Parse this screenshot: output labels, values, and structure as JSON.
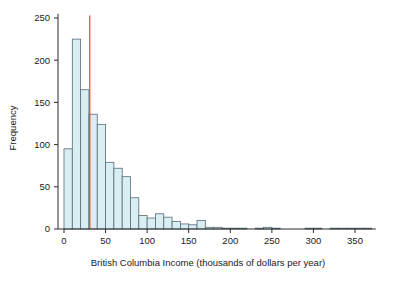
{
  "figure": {
    "background_color": "#ffffff",
    "axis_color": "#2b2b2b",
    "text_color": "#1a1a1a"
  },
  "axes": {
    "y_title": "Frequency",
    "x_title": "British Columbia Income (thousands of dollars per year)",
    "y_ticks": [
      0,
      50,
      100,
      150,
      200,
      250
    ],
    "x_ticks": [
      0,
      50,
      100,
      150,
      200,
      250,
      300,
      350
    ],
    "y_tick_labels": [
      "0",
      "50",
      "100",
      "150",
      "200",
      "250"
    ],
    "x_tick_labels": [
      "0",
      "50",
      "100",
      "150",
      "200",
      "250",
      "300",
      "350"
    ]
  },
  "chart_data": {
    "type": "bar",
    "title": "",
    "subtitle": "",
    "xlabel": "British Columbia Income (thousands of dollars per year)",
    "ylabel": "Frequency",
    "xlim": [
      0,
      375
    ],
    "ylim": [
      0,
      255
    ],
    "grid": false,
    "legend": null,
    "bin_width": 10,
    "bar_fill_color": "#d9eef2",
    "bar_edge_color": "#5a6b73",
    "bin_starts": [
      0,
      10,
      20,
      30,
      40,
      50,
      60,
      70,
      80,
      90,
      100,
      110,
      120,
      130,
      140,
      150,
      160,
      170,
      180,
      190,
      200,
      210,
      230,
      240,
      250,
      290,
      300,
      320,
      330,
      340,
      350,
      360
    ],
    "bin_labels": [
      "0-10",
      "10-20",
      "20-30",
      "30-40",
      "40-50",
      "50-60",
      "60-70",
      "70-80",
      "80-90",
      "90-100",
      "100-110",
      "110-120",
      "120-130",
      "130-140",
      "140-150",
      "150-160",
      "160-170",
      "170-180",
      "180-190",
      "190-200",
      "200-210",
      "210-220",
      "230-240",
      "240-250",
      "250-260",
      "290-300",
      "300-310",
      "320-330",
      "330-340",
      "340-350",
      "350-360",
      "360-370"
    ],
    "values": [
      95,
      225,
      165,
      136,
      124,
      79,
      72,
      62,
      37,
      16,
      13,
      18,
      14,
      9,
      6,
      5,
      10,
      2,
      2,
      1,
      1,
      1,
      1,
      2,
      1,
      1,
      1,
      1,
      1,
      1,
      1,
      1
    ],
    "annotations": [
      {
        "name": "median-marker",
        "type": "vertical-line",
        "x_value": 31,
        "y_from": 0,
        "y_to": 253,
        "color": "#e8402a"
      }
    ]
  }
}
